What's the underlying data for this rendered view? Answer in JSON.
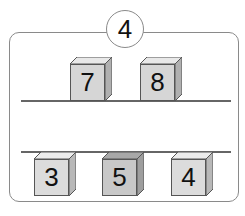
{
  "badge": {
    "number": "4"
  },
  "top_row": {
    "cubes": [
      {
        "value": "7",
        "front_color": "#d6d6d6",
        "side_color": "#b0b0b0"
      },
      {
        "value": "8",
        "front_color": "#d6d6d6",
        "side_color": "#b0b0b0"
      }
    ]
  },
  "bottom_row": {
    "cubes": [
      {
        "value": "3",
        "front_color": "#dcdcdc",
        "side_color": "#b8b8b8"
      },
      {
        "value": "5",
        "front_color": "#c8c8c8",
        "side_color": "#9e9e9e"
      },
      {
        "value": "4",
        "front_color": "#dcdcdc",
        "side_color": "#b8b8b8"
      }
    ]
  }
}
